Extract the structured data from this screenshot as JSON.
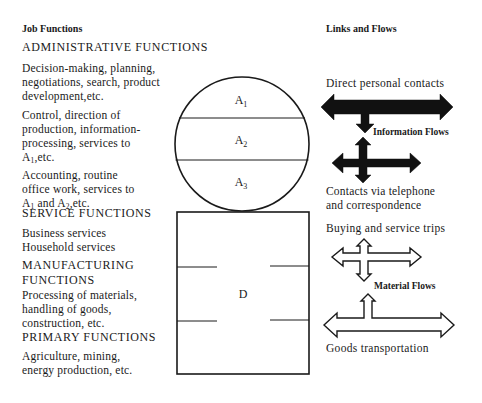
{
  "left_column": {
    "header": "Job Functions",
    "administrative": {
      "title": "ADMINISTRATIVE FUNCTIONS",
      "a1_desc": [
        "Decision-making, planning,",
        "negotiations, search, product",
        "development,etc."
      ],
      "a2_desc": [
        "Control, direction of",
        "production, information-",
        "processing, services to"
      ],
      "a2_desc_last_prefix": "A",
      "a2_desc_last_sub": "1",
      "a2_desc_last_suffix": ",etc.",
      "a3_desc": [
        "Accounting, routine",
        "office work, services to"
      ],
      "a3_desc_last": {
        "p1": "A",
        "s1": "1",
        "mid": " and A",
        "s2": "2",
        "end": ",etc."
      }
    },
    "service": {
      "title": "SERVICE FUNCTIONS",
      "items": [
        "Business services",
        "Household services"
      ]
    },
    "manufacturing": {
      "title_lines": [
        "MANUFACTURING",
        "FUNCTIONS"
      ],
      "desc": [
        "Processing of materials,",
        "handling of goods,",
        "construction, etc."
      ]
    },
    "primary": {
      "title": "PRIMARY FUNCTIONS",
      "desc": [
        "Agriculture, mining,",
        "energy production, etc."
      ]
    }
  },
  "center_diagram": {
    "circle_zones": [
      {
        "label": "A",
        "sub": "1"
      },
      {
        "label": "A",
        "sub": "2"
      },
      {
        "label": "A",
        "sub": "3"
      }
    ],
    "box_label": "D"
  },
  "right_column": {
    "header": "Links and Flows",
    "information": {
      "top_label": "Direct personal contacts",
      "group_label": "Information Flows",
      "bottom_label": [
        "Contacts via telephone",
        "and correspondence"
      ],
      "color": "#111111"
    },
    "material": {
      "top_label": "Buying and service trips",
      "group_label": "Material Flows",
      "bottom_label": "Goods transportation",
      "color": "#ffffff"
    }
  }
}
